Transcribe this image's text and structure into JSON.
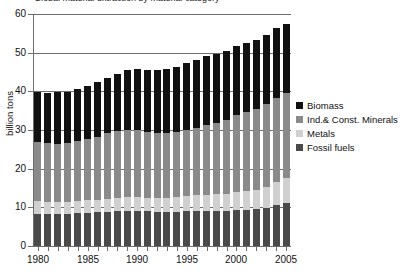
{
  "figure": {
    "title_fragment": "Global material extraction by material category"
  },
  "chart_data": {
    "type": "bar",
    "stacked": true,
    "title": "",
    "xlabel": "",
    "ylabel": "billion tons",
    "ylim": [
      0,
      60
    ],
    "yticks": [
      0,
      10,
      20,
      30,
      40,
      50,
      60
    ],
    "grid": true,
    "legend_position": "right",
    "categories": [
      "1980",
      "1981",
      "1982",
      "1983",
      "1984",
      "1985",
      "1986",
      "1987",
      "1988",
      "1989",
      "1990",
      "1991",
      "1992",
      "1993",
      "1994",
      "1995",
      "1996",
      "1997",
      "1998",
      "1999",
      "2000",
      "2001",
      "2002",
      "2003",
      "2004",
      "2005"
    ],
    "xtick_labels": [
      "1980",
      "1985",
      "1990",
      "1995",
      "2000",
      "2005"
    ],
    "series": [
      {
        "name": "Fossil fuels",
        "color": "#4a4a4a",
        "values": [
          8.3,
          8.3,
          8.3,
          8.3,
          8.5,
          8.6,
          8.8,
          8.9,
          9.0,
          9.1,
          9.1,
          9.0,
          8.9,
          8.9,
          8.9,
          9.0,
          9.1,
          9.1,
          9.1,
          9.1,
          9.3,
          9.4,
          9.5,
          9.9,
          10.6,
          11.2
        ]
      },
      {
        "name": "Metals",
        "color": "#d0d0d0",
        "values": [
          3.3,
          3.2,
          3.1,
          3.1,
          3.2,
          3.2,
          3.2,
          3.3,
          3.4,
          3.5,
          3.5,
          3.5,
          3.5,
          3.6,
          3.8,
          3.9,
          4.0,
          4.2,
          4.3,
          4.4,
          4.7,
          4.8,
          5.0,
          5.4,
          5.9,
          6.4
        ]
      },
      {
        "name": "Ind.& Const. Minerals",
        "color": "#8a8a8a",
        "values": [
          15.4,
          15.2,
          15.1,
          15.2,
          15.5,
          15.9,
          16.3,
          17.0,
          17.3,
          17.5,
          17.4,
          17.0,
          16.9,
          16.8,
          16.9,
          17.0,
          17.3,
          17.9,
          18.5,
          19.2,
          19.8,
          20.5,
          21.0,
          21.5,
          21.9,
          22.0
        ]
      },
      {
        "name": "Biomass",
        "color": "#111111",
        "values": [
          12.7,
          12.9,
          13.2,
          13.2,
          13.5,
          13.7,
          14.0,
          14.2,
          14.9,
          15.4,
          15.7,
          16.1,
          16.3,
          16.5,
          16.7,
          17.4,
          17.7,
          18.0,
          17.7,
          17.8,
          17.9,
          17.7,
          17.8,
          17.8,
          17.9,
          17.8
        ]
      }
    ],
    "totals": [
      39.7,
      39.6,
      39.7,
      39.8,
      40.7,
      41.4,
      42.3,
      43.4,
      44.6,
      45.5,
      45.7,
      45.6,
      45.6,
      45.8,
      46.3,
      47.3,
      48.1,
      49.2,
      49.6,
      50.5,
      51.7,
      52.4,
      53.3,
      54.6,
      56.3,
      57.4
    ]
  }
}
